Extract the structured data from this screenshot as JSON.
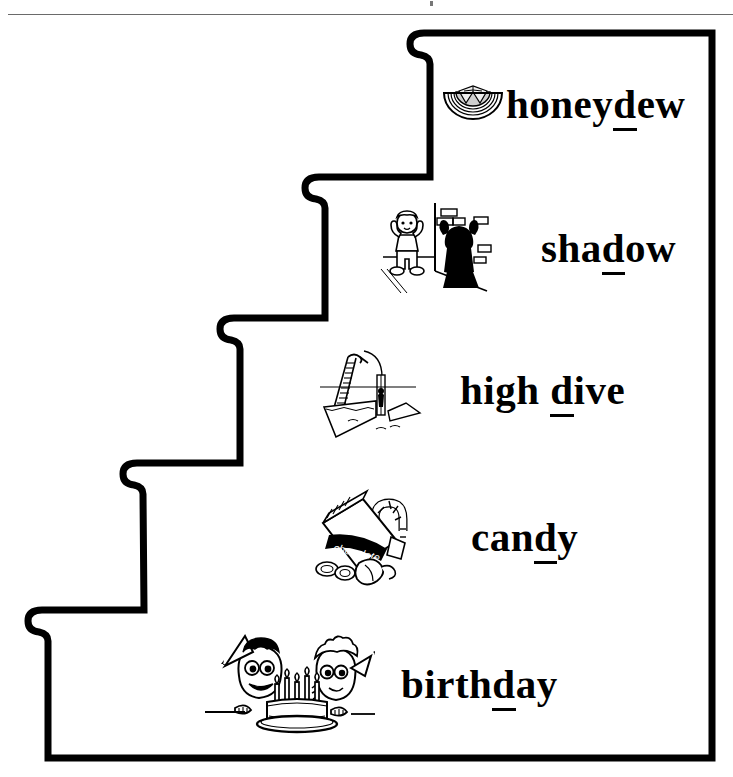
{
  "page": {
    "background_color": "#ffffff",
    "ink_color": "#000000",
    "rule_color": "#6a6a6a"
  },
  "staircase": {
    "description": "Five-step staircase outline drawn in heavy black line, descending from upper right to lower left",
    "step_count": 5,
    "outline_width_px": 7
  },
  "steps": [
    {
      "index": 1,
      "word_prefix": "",
      "word_underlined": "d",
      "word_before": "honey",
      "word_after": "ew",
      "full_word": "honeydew",
      "art_name": "honeydew-melon-slice",
      "art_caption": ""
    },
    {
      "index": 2,
      "word_prefix": "",
      "word_underlined": "d",
      "word_before": "sha",
      "word_after": "ow",
      "full_word": "shadow",
      "art_name": "child-casting-shadow-on-brick-wall",
      "art_caption": ""
    },
    {
      "index": 3,
      "word_prefix": "",
      "word_underlined": "d",
      "word_before": "high ",
      "word_after": "ive",
      "full_word": "high dive",
      "art_name": "high-diving-board-over-pool",
      "art_caption": ""
    },
    {
      "index": 4,
      "word_prefix": "",
      "word_underlined": "d",
      "word_before": "can",
      "word_after": "y",
      "full_word": "candy",
      "art_name": "chocolate-bar-and-candy-cane",
      "art_caption": "chocolate"
    },
    {
      "index": 5,
      "word_prefix": "",
      "word_underlined": "d",
      "word_before": "birth",
      "word_after": "ay",
      "full_word": "birthday",
      "art_name": "two-children-with-birthday-cake",
      "art_caption": ""
    }
  ]
}
